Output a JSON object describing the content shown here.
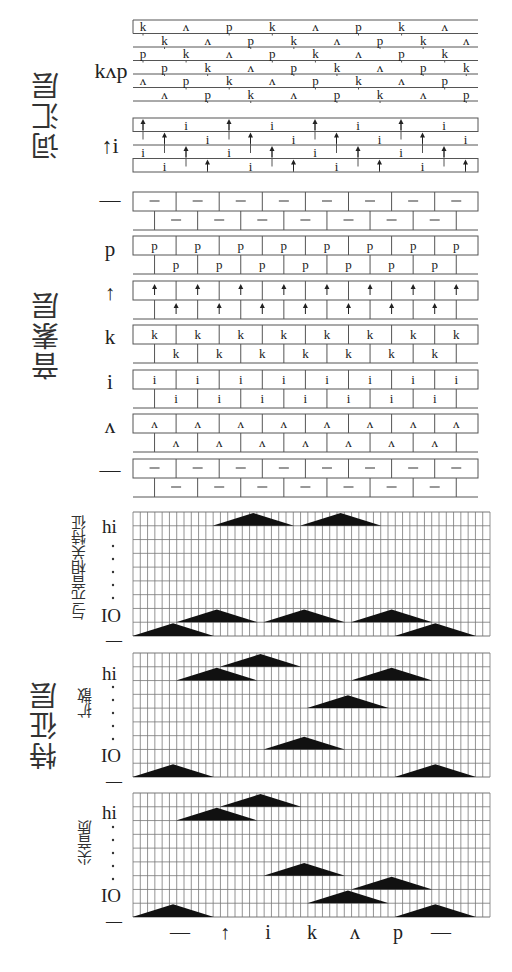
{
  "layers": {
    "lexical": "词汇层",
    "phoneme": "音素层",
    "feature": "特征层"
  },
  "lexical_units": [
    {
      "label": "kʌp",
      "top": 20,
      "rows": 6,
      "row_h": 13.5,
      "sequence": [
        "k",
        "ʌ",
        "p"
      ]
    },
    {
      "label": "↑i",
      "top": 118,
      "rows": 4,
      "row_h": 13.5,
      "sequence": [
        "↑",
        "i"
      ]
    }
  ],
  "phoneme_units": [
    {
      "label": "—",
      "glyph": "—",
      "top": 192
    },
    {
      "label": "p",
      "glyph": "p",
      "top": 236
    },
    {
      "label": "↑",
      "glyph": "↑",
      "top": 281
    },
    {
      "label": "k",
      "glyph": "k",
      "top": 325
    },
    {
      "label": "i",
      "glyph": "i",
      "top": 370
    },
    {
      "label": "ʌ",
      "glyph": "ʌ",
      "top": 414
    },
    {
      "label": "—",
      "glyph": "—",
      "top": 459
    }
  ],
  "feature_panels": [
    {
      "name": "与元音相关特征",
      "top": 512,
      "hi_label": "hi",
      "lo_label": "IO",
      "dash_top": "",
      "dash_bottom": "—",
      "triangles": [
        {
          "row": 0,
          "center_col": 16,
          "half_width": 5
        },
        {
          "row": 0,
          "center_col": 28,
          "half_width": 5
        },
        {
          "row": 7,
          "center_col": 11,
          "half_width": 5
        },
        {
          "row": 7,
          "center_col": 23,
          "half_width": 5
        },
        {
          "row": 7,
          "center_col": 35,
          "half_width": 5
        },
        {
          "row": 8,
          "center_col": 5,
          "half_width": 5
        },
        {
          "row": 8,
          "center_col": 41,
          "half_width": 5
        }
      ]
    },
    {
      "name": "扩散",
      "top": 653,
      "hi_label": "hi",
      "lo_label": "IO",
      "dash_top": "—",
      "dash_bottom": "—",
      "triangles": [
        {
          "row": 0,
          "center_col": 17,
          "half_width": 5
        },
        {
          "row": 1,
          "center_col": 11,
          "half_width": 5
        },
        {
          "row": 1,
          "center_col": 35,
          "half_width": 5
        },
        {
          "row": 3,
          "center_col": 29,
          "half_width": 5
        },
        {
          "row": 6,
          "center_col": 23,
          "half_width": 5
        },
        {
          "row": 8,
          "center_col": 5,
          "half_width": 5
        },
        {
          "row": 8,
          "center_col": 41,
          "half_width": 5
        }
      ]
    },
    {
      "name": "尖音质",
      "top": 793,
      "hi_label": "hi",
      "lo_label": "IO",
      "dash_top": "—",
      "dash_bottom": "—",
      "triangles": [
        {
          "row": 0,
          "center_col": 17,
          "half_width": 5
        },
        {
          "row": 1,
          "center_col": 11,
          "half_width": 5
        },
        {
          "row": 5,
          "center_col": 23,
          "half_width": 5
        },
        {
          "row": 6,
          "center_col": 35,
          "half_width": 5
        },
        {
          "row": 7,
          "center_col": 29,
          "half_width": 5
        },
        {
          "row": 8,
          "center_col": 5,
          "half_width": 5
        },
        {
          "row": 8,
          "center_col": 41,
          "half_width": 5
        }
      ]
    }
  ],
  "grid": {
    "left": 133,
    "right": 490,
    "cols": 49,
    "rows": 9,
    "height": 124
  },
  "input_sequence": [
    "—",
    "↑",
    "i",
    "k",
    "ʌ",
    "p",
    "—"
  ],
  "colors": {
    "line": "#555555",
    "fill": "#111111",
    "grid": "#777777"
  }
}
